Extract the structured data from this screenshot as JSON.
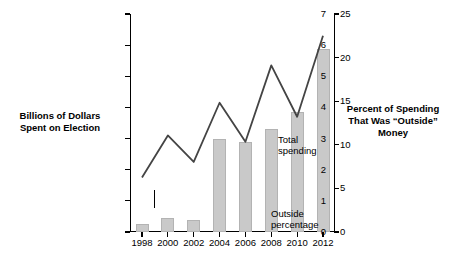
{
  "chart_data": {
    "type": "line",
    "title": "",
    "subtitle": "",
    "xlabel": "",
    "ylabel": "Billions of Dollars Spent on Election",
    "y2label": "Percent of Spending That Was “Outside” Money",
    "grid": false,
    "legend_position": "inline-annotations",
    "x": [
      1998,
      2000,
      2002,
      2004,
      2006,
      2008,
      2010,
      2012
    ],
    "xtick_labels": [
      "1998",
      "2000",
      "2002",
      "2004",
      "2006",
      "2008",
      "2010",
      "2012"
    ],
    "ylim": [
      0,
      7
    ],
    "ytick_labels": [
      "0",
      "1",
      "2",
      "3",
      "4",
      "5",
      "6",
      "7"
    ],
    "y2lim": [
      0,
      25
    ],
    "y2tick_labels": [
      "0",
      "5",
      "10",
      "15",
      "20",
      "25"
    ],
    "series": [
      {
        "name": "Total spending",
        "type": "line",
        "axis": "left",
        "color": "#444444",
        "values": [
          1.75,
          3.1,
          2.25,
          4.15,
          2.9,
          5.35,
          3.7,
          6.3
        ]
      },
      {
        "name": "Outside percentage",
        "type": "bar",
        "axis": "right",
        "color": "#c9c9c9",
        "values": [
          0.9,
          1.6,
          1.4,
          10.7,
          10.3,
          11.8,
          13.8,
          21.0
        ]
      }
    ],
    "annotations": [
      {
        "name": "total-spending",
        "text": "Total\nspending"
      },
      {
        "name": "outside-percentage",
        "text": "Outside\npercentage"
      }
    ]
  },
  "labels": {
    "left_axis": "Billions of Dollars Spent on Election",
    "right_axis": "Percent of Spending That Was “Outside” Money",
    "annot_total_line1": "Total",
    "annot_total_line2": "spending",
    "annot_outside_line1": "Outside",
    "annot_outside_line2": "percentage"
  }
}
